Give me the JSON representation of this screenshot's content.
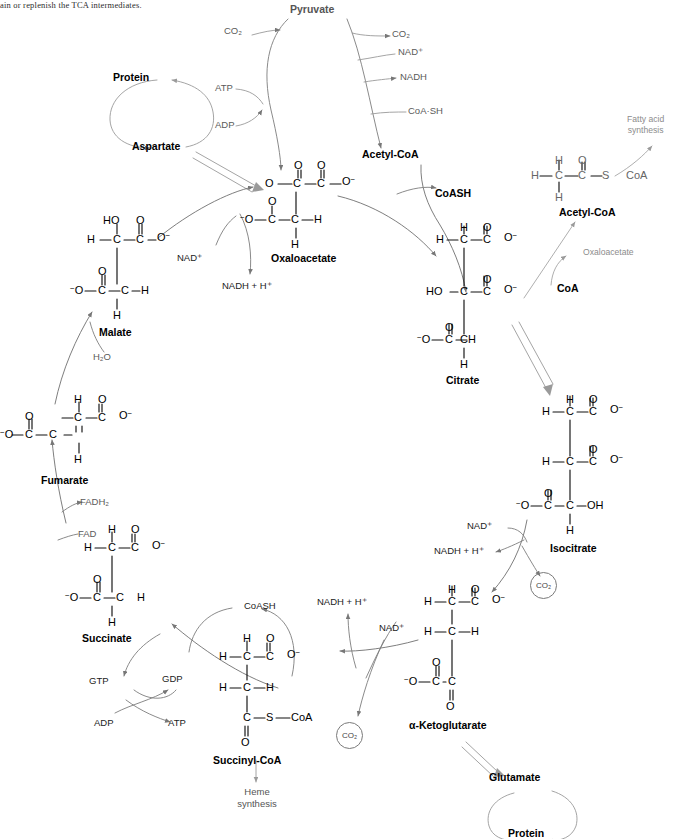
{
  "page": {
    "width": 692,
    "height": 839,
    "background": "#ffffff",
    "top_caption": "ain or replenish the TCA intermediates."
  },
  "colors": {
    "ink": "#000000",
    "grey_text": "#5a5a5a",
    "light_grey": "#8c8c8c",
    "arrow_grey": "#777777",
    "arrow_dark": "#4a4a4a"
  },
  "compounds": {
    "pyruvate": "Pyruvate",
    "acetyl_coa_main": "Acetyl-CoA",
    "acetyl_coa_side": "Acetyl-CoA",
    "oxaloacetate": "Oxaloacetate",
    "citrate": "Citrate",
    "isocitrate": "Isocitrate",
    "alpha_ketoglutarate": "α-Ketoglutarate",
    "succinyl_coa": "Succinyl-CoA",
    "succinate": "Succinate",
    "fumarate": "Fumarate",
    "malate": "Malate",
    "protein_top": "Protein",
    "aspartate": "Aspartate",
    "glutamate": "Glutamate",
    "protein_bottom": "Protein",
    "coa": "CoA",
    "coash_top": "CoASH",
    "coash_bottom": "CoASH"
  },
  "cofactors": {
    "co2_pyruvate": "CO₂",
    "nad_plus_pdh": "NAD⁺",
    "nadh_pdh": "NADH",
    "coa_sh_pdh": "CoA·SH",
    "atp_pepck": "ATP",
    "adp_pepck": "ADP",
    "nad_plus_mdh": "NAD⁺",
    "nadh_h_mdh": "NADH + H⁺",
    "h2o_fumarase": "H₂O",
    "fadh2": "FADH₂",
    "fad": "FAD",
    "gtp": "GTP",
    "gdp": "GDP",
    "adp_nk": "ADP",
    "atp_nk": "ATP",
    "nad_plus_idh": "NAD⁺",
    "nadh_h_idh": "NADH +  H⁺",
    "co2_idh": "CO₂",
    "nad_plus_kgdh": "NAD⁺",
    "nadh_h_kgdh": "NADH +  H⁺",
    "co2_kgdh": "CO₂"
  },
  "side_notes": {
    "fatty_acid_synthesis": "Fatty acid\nsynthesis",
    "fatty_acid_synthesis_l1": "Fatty acid",
    "fatty_acid_synthesis_l2": "synthesis",
    "oxaloacetate_note": "Oxaloacetate",
    "heme_synthesis_l1": "Heme",
    "heme_synthesis_l2": "synthesis"
  },
  "structures": {
    "oxaloacetate": {
      "name": "Oxaloacetate",
      "atoms": [
        "O",
        "O",
        "O",
        "C",
        "C",
        "O⁻",
        "⁻O",
        "C",
        "C",
        "H",
        "H"
      ],
      "formula_rows": [
        "O=C–C–O⁻ (top carboxylate with ketone O)",
        "⁻O–C–C–H",
        "H"
      ]
    },
    "acetyl_coa": {
      "name": "Acetyl-CoA",
      "atoms": [
        "H",
        "O",
        "H",
        "C",
        "C",
        "S",
        "CoA",
        "H"
      ]
    },
    "citrate": {
      "name": "Citrate",
      "atoms": [
        "H",
        "O",
        "H",
        "C",
        "C",
        "O⁻",
        "O",
        "HO",
        "C",
        "C",
        "O⁻",
        "O",
        "⁻O",
        "C",
        "C",
        "H",
        "H"
      ]
    },
    "isocitrate": {
      "name": "Isocitrate",
      "atoms": [
        "H",
        "O",
        "H",
        "C",
        "C",
        "O⁻",
        "O",
        "H",
        "C",
        "C",
        "O⁻",
        "O",
        "⁻O",
        "C",
        "C",
        "OH",
        "H"
      ]
    },
    "alpha_ketoglutarate": {
      "name": "α-Ketoglutarate",
      "atoms": [
        "H",
        "O",
        "H",
        "C",
        "C",
        "O⁻",
        "H",
        "C",
        "H",
        "O",
        "⁻O",
        "C",
        "C",
        "O"
      ]
    },
    "succinyl_coa": {
      "name": "Succinyl-CoA",
      "atoms": [
        "H",
        "O",
        "H",
        "C",
        "C",
        "O⁻",
        "H",
        "C",
        "H",
        "C",
        "S",
        "CoA",
        "O"
      ]
    },
    "succinate": {
      "name": "Succinate",
      "atoms": [
        "H",
        "O",
        "H",
        "C",
        "C",
        "O⁻",
        "O",
        "⁻O",
        "C",
        "C",
        "H",
        "H"
      ]
    },
    "fumarate": {
      "name": "Fumarate",
      "atoms": [
        "H",
        "O",
        "C",
        "C",
        "O⁻",
        "O",
        "⁻O",
        "C",
        "C",
        "H"
      ]
    },
    "malate": {
      "name": "Malate",
      "atoms": [
        "HO",
        "O",
        "H",
        "C",
        "C",
        "O⁻",
        "O",
        "⁻O",
        "C",
        "C",
        "H",
        "H"
      ]
    }
  },
  "atoms": {
    "C": "C",
    "H": "H",
    "O": "O",
    "S": "S",
    "N": "N",
    "CoA": "CoA",
    "HO": "HO",
    "OH": "OH",
    "O_minus": "O⁻",
    "minus_O": "⁻O"
  }
}
